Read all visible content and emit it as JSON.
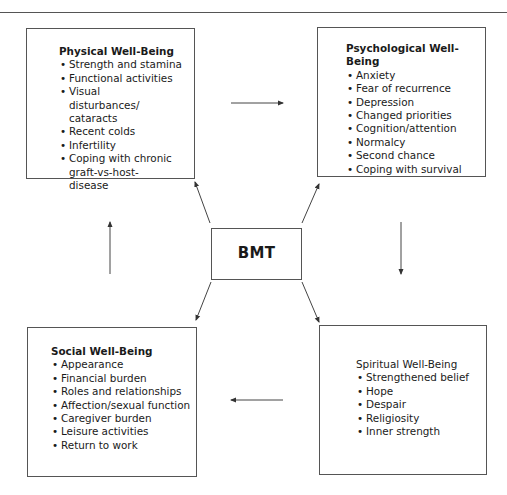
{
  "center": {
    "label": "BMT"
  },
  "boxes": {
    "physical": {
      "title": "Physical Well-Being",
      "items": [
        "Strength and stamina",
        "Functional activities",
        "Visual disturbances/ cataracts",
        "Recent colds",
        "Infertility",
        "Coping with chronic graft-vs-host-disease"
      ]
    },
    "psychological": {
      "title": "Psychological Well-Being",
      "items": [
        "Anxiety",
        "Fear of recurrence",
        "Depression",
        "Changed priorities",
        "Cognition/attention",
        "Normalcy",
        "Second chance",
        "Coping with survival"
      ]
    },
    "social": {
      "title": "Social Well-Being",
      "items": [
        "Appearance",
        "Financial burden",
        "Roles and relationships",
        "Affection/sexual function",
        "Caregiver burden",
        "Leisure activities",
        "Return to work"
      ]
    },
    "spiritual": {
      "title": "Spiritual Well-Being",
      "items": [
        "Strengthened belief",
        "Hope",
        "Despair",
        "Religiosity",
        "Inner strength"
      ]
    }
  },
  "colors": {
    "line": "#555555",
    "text": "#1a1a1a",
    "background": "#ffffff"
  }
}
